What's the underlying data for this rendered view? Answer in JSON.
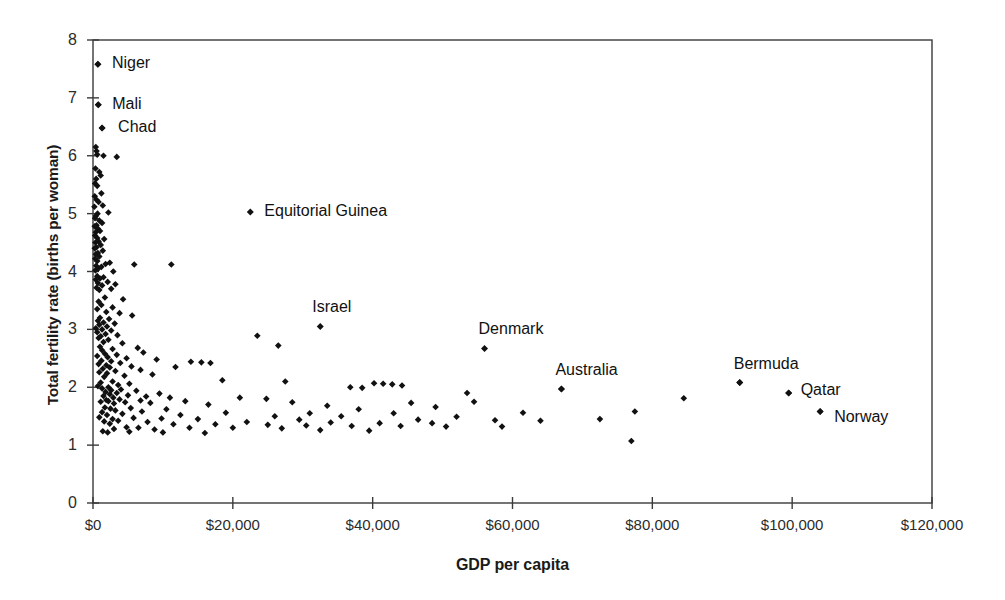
{
  "chart_data": {
    "type": "scatter",
    "title": "",
    "xlabel": "GDP per capita",
    "ylabel": "Total fertility rate (births per woman)",
    "xlim": [
      0,
      120000
    ],
    "ylim": [
      0,
      8
    ],
    "grid": false,
    "legend": null,
    "xticks": [
      0,
      20000,
      40000,
      60000,
      80000,
      100000,
      120000
    ],
    "xticklabels": [
      "$0",
      "$20,000",
      "$40,000",
      "$60,000",
      "$80,000",
      "$100,000",
      "$120,000"
    ],
    "yticks": [
      0,
      1,
      2,
      3,
      4,
      5,
      6,
      7,
      8
    ],
    "yticklabels": [
      "0",
      "1",
      "2",
      "3",
      "4",
      "5",
      "6",
      "7",
      "8"
    ],
    "marker": "diamond",
    "marker_color": "#111111",
    "annotations": [
      {
        "label": "Niger",
        "x": 700,
        "y": 7.58,
        "dx": 14,
        "dy": -9
      },
      {
        "label": "Mali",
        "x": 750,
        "y": 6.88,
        "dx": 14,
        "dy": -9
      },
      {
        "label": "Chad",
        "x": 1300,
        "y": 6.48,
        "dx": 16,
        "dy": -9
      },
      {
        "label": "Equitorial Guinea",
        "x": 22500,
        "y": 5.03,
        "dx": 14,
        "dy": -9
      },
      {
        "label": "Israel",
        "x": 32500,
        "y": 3.05,
        "dx": -8,
        "dy": -27
      },
      {
        "label": "Denmark",
        "x": 56000,
        "y": 2.67,
        "dx": -6,
        "dy": -27
      },
      {
        "label": "Australia",
        "x": 67000,
        "y": 1.97,
        "dx": -6,
        "dy": -27
      },
      {
        "label": "Bermuda",
        "x": 92500,
        "y": 2.08,
        "dx": -6,
        "dy": -27
      },
      {
        "label": "Qatar",
        "x": 99500,
        "y": 1.9,
        "dx": 12,
        "dy": -11
      },
      {
        "label": "Norway",
        "x": 104000,
        "y": 1.58,
        "dx": 14,
        "dy": -3
      }
    ],
    "points": [
      [
        700,
        7.58
      ],
      [
        750,
        6.88
      ],
      [
        1300,
        6.48
      ],
      [
        400,
        6.15
      ],
      [
        500,
        6.08
      ],
      [
        600,
        6.02
      ],
      [
        1500,
        6.0
      ],
      [
        3400,
        5.98
      ],
      [
        350,
        5.78
      ],
      [
        900,
        5.72
      ],
      [
        1100,
        5.66
      ],
      [
        450,
        5.6
      ],
      [
        300,
        5.52
      ],
      [
        600,
        5.48
      ],
      [
        1200,
        5.35
      ],
      [
        250,
        5.3
      ],
      [
        500,
        5.24
      ],
      [
        800,
        5.2
      ],
      [
        1400,
        5.14
      ],
      [
        200,
        5.12
      ],
      [
        2200,
        5.02
      ],
      [
        650,
        5.0
      ],
      [
        400,
        4.96
      ],
      [
        300,
        4.92
      ],
      [
        900,
        4.88
      ],
      [
        1300,
        4.84
      ],
      [
        500,
        4.8
      ],
      [
        250,
        4.78
      ],
      [
        700,
        4.74
      ],
      [
        1000,
        4.7
      ],
      [
        400,
        4.68
      ],
      [
        300,
        4.62
      ],
      [
        600,
        4.58
      ],
      [
        1600,
        4.56
      ],
      [
        800,
        4.52
      ],
      [
        350,
        4.5
      ],
      [
        1100,
        4.46
      ],
      [
        500,
        4.42
      ],
      [
        250,
        4.4
      ],
      [
        1400,
        4.36
      ],
      [
        700,
        4.32
      ],
      [
        400,
        4.3
      ],
      [
        900,
        4.26
      ],
      [
        300,
        4.22
      ],
      [
        600,
        4.18
      ],
      [
        2400,
        4.15
      ],
      [
        1800,
        4.13
      ],
      [
        5900,
        4.12
      ],
      [
        11200,
        4.12
      ],
      [
        450,
        4.1
      ],
      [
        1200,
        4.08
      ],
      [
        750,
        4.05
      ],
      [
        350,
        4.02
      ],
      [
        2900,
        4.0
      ],
      [
        600,
        3.92
      ],
      [
        1500,
        3.9
      ],
      [
        1000,
        3.88
      ],
      [
        400,
        3.86
      ],
      [
        2100,
        3.82
      ],
      [
        700,
        3.8
      ],
      [
        3200,
        3.78
      ],
      [
        1300,
        3.76
      ],
      [
        500,
        3.72
      ],
      [
        2600,
        3.7
      ],
      [
        900,
        3.68
      ],
      [
        1700,
        3.55
      ],
      [
        4300,
        3.52
      ],
      [
        800,
        3.48
      ],
      [
        1200,
        3.42
      ],
      [
        2800,
        3.38
      ],
      [
        600,
        3.35
      ],
      [
        1900,
        3.3
      ],
      [
        3800,
        3.28
      ],
      [
        5600,
        3.24
      ],
      [
        1000,
        3.2
      ],
      [
        2300,
        3.18
      ],
      [
        700,
        3.15
      ],
      [
        1500,
        3.12
      ],
      [
        3100,
        3.1
      ],
      [
        900,
        3.08
      ],
      [
        2000,
        3.05
      ],
      [
        400,
        3.02
      ],
      [
        1300,
        3.0
      ],
      [
        2600,
        2.98
      ],
      [
        600,
        2.95
      ],
      [
        1800,
        2.92
      ],
      [
        3500,
        2.9
      ],
      [
        23500,
        2.89
      ],
      [
        1100,
        2.88
      ],
      [
        800,
        2.85
      ],
      [
        2200,
        2.82
      ],
      [
        1500,
        2.78
      ],
      [
        4200,
        2.76
      ],
      [
        26500,
        2.72
      ],
      [
        1000,
        2.7
      ],
      [
        6400,
        2.68
      ],
      [
        2800,
        2.66
      ],
      [
        1300,
        2.64
      ],
      [
        7200,
        2.6
      ],
      [
        1700,
        2.58
      ],
      [
        3400,
        2.56
      ],
      [
        600,
        2.54
      ],
      [
        2100,
        2.52
      ],
      [
        4800,
        2.5
      ],
      [
        9100,
        2.48
      ],
      [
        1200,
        2.46
      ],
      [
        2600,
        2.45
      ],
      [
        14000,
        2.44
      ],
      [
        15500,
        2.43
      ],
      [
        16800,
        2.42
      ],
      [
        3900,
        2.42
      ],
      [
        800,
        2.4
      ],
      [
        1900,
        2.38
      ],
      [
        5500,
        2.36
      ],
      [
        11800,
        2.35
      ],
      [
        2400,
        2.34
      ],
      [
        1400,
        2.32
      ],
      [
        6800,
        2.3
      ],
      [
        3200,
        2.28
      ],
      [
        900,
        2.26
      ],
      [
        2000,
        2.24
      ],
      [
        8500,
        2.22
      ],
      [
        4500,
        2.2
      ],
      [
        1600,
        2.18
      ],
      [
        18500,
        2.12
      ],
      [
        2800,
        2.1
      ],
      [
        1100,
        2.08
      ],
      [
        5200,
        2.06
      ],
      [
        3600,
        2.04
      ],
      [
        700,
        2.02
      ],
      [
        2200,
        2.0
      ],
      [
        27500,
        2.1
      ],
      [
        40200,
        2.07
      ],
      [
        41500,
        2.06
      ],
      [
        42800,
        2.05
      ],
      [
        44200,
        2.03
      ],
      [
        36800,
        2.0
      ],
      [
        38500,
        1.99
      ],
      [
        67000,
        1.97
      ],
      [
        1300,
        1.98
      ],
      [
        4000,
        1.96
      ],
      [
        2600,
        1.95
      ],
      [
        6200,
        1.94
      ],
      [
        1800,
        1.92
      ],
      [
        3400,
        1.9
      ],
      [
        9500,
        1.89
      ],
      [
        2400,
        1.88
      ],
      [
        5000,
        1.86
      ],
      [
        1500,
        1.85
      ],
      [
        7600,
        1.84
      ],
      [
        2900,
        1.82
      ],
      [
        11000,
        1.82
      ],
      [
        21000,
        1.82
      ],
      [
        24800,
        1.8
      ],
      [
        53500,
        1.9
      ],
      [
        84500,
        1.81
      ],
      [
        92500,
        2.08
      ],
      [
        99500,
        1.9
      ],
      [
        3800,
        1.79
      ],
      [
        1900,
        1.78
      ],
      [
        6800,
        1.77
      ],
      [
        2200,
        1.76
      ],
      [
        13200,
        1.76
      ],
      [
        28500,
        1.74
      ],
      [
        45500,
        1.73
      ],
      [
        54500,
        1.75
      ],
      [
        1100,
        1.75
      ],
      [
        4600,
        1.74
      ],
      [
        8200,
        1.73
      ],
      [
        3000,
        1.72
      ],
      [
        16500,
        1.7
      ],
      [
        33500,
        1.68
      ],
      [
        49000,
        1.66
      ],
      [
        1700,
        1.65
      ],
      [
        5400,
        1.64
      ],
      [
        2500,
        1.63
      ],
      [
        10500,
        1.62
      ],
      [
        38000,
        1.62
      ],
      [
        104000,
        1.58
      ],
      [
        77500,
        1.58
      ],
      [
        3200,
        1.6
      ],
      [
        7000,
        1.58
      ],
      [
        1300,
        1.57
      ],
      [
        19000,
        1.56
      ],
      [
        31000,
        1.55
      ],
      [
        43000,
        1.55
      ],
      [
        61500,
        1.56
      ],
      [
        4200,
        1.54
      ],
      [
        2000,
        1.52
      ],
      [
        12500,
        1.52
      ],
      [
        26000,
        1.5
      ],
      [
        35500,
        1.5
      ],
      [
        52000,
        1.49
      ],
      [
        900,
        1.48
      ],
      [
        5800,
        1.47
      ],
      [
        9800,
        1.46
      ],
      [
        2800,
        1.45
      ],
      [
        15000,
        1.45
      ],
      [
        29500,
        1.44
      ],
      [
        46500,
        1.44
      ],
      [
        57500,
        1.43
      ],
      [
        64000,
        1.42
      ],
      [
        3600,
        1.42
      ],
      [
        1600,
        1.41
      ],
      [
        7800,
        1.4
      ],
      [
        22000,
        1.4
      ],
      [
        34000,
        1.39
      ],
      [
        41000,
        1.38
      ],
      [
        48500,
        1.38
      ],
      [
        2400,
        1.37
      ],
      [
        11500,
        1.36
      ],
      [
        17500,
        1.36
      ],
      [
        25000,
        1.35
      ],
      [
        30500,
        1.34
      ],
      [
        37000,
        1.33
      ],
      [
        44000,
        1.33
      ],
      [
        50500,
        1.32
      ],
      [
        58500,
        1.32
      ],
      [
        4800,
        1.31
      ],
      [
        6500,
        1.3
      ],
      [
        13800,
        1.3
      ],
      [
        20000,
        1.3
      ],
      [
        27000,
        1.29
      ],
      [
        3000,
        1.28
      ],
      [
        8800,
        1.27
      ],
      [
        32500,
        1.26
      ],
      [
        39500,
        1.25
      ],
      [
        1400,
        1.24
      ],
      [
        5200,
        1.23
      ],
      [
        2100,
        1.22
      ],
      [
        10000,
        1.22
      ],
      [
        16000,
        1.21
      ],
      [
        77000,
        1.07
      ],
      [
        72500,
        1.45
      ]
    ]
  }
}
